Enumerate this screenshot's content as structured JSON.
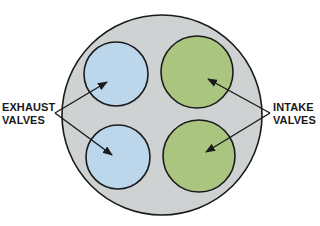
{
  "diagram": {
    "type": "cylinder-head-valve-layout",
    "colors": {
      "cylinder_fill": "#cfd2d2",
      "exhaust_fill": "#bcd7ec",
      "intake_fill": "#a9c57f",
      "outline": "#1a1a1a"
    },
    "labels": {
      "exhaust": {
        "line1": "EXHAUST",
        "line2": "VALVES"
      },
      "intake": {
        "line1": "INTAKE",
        "line2": "VALVES"
      }
    },
    "valves": [
      {
        "name": "exhaust-valve-top",
        "type": "exhaust",
        "cx": 116,
        "cy": 74,
        "r": 32
      },
      {
        "name": "exhaust-valve-bottom",
        "type": "exhaust",
        "cx": 118,
        "cy": 157,
        "r": 32
      },
      {
        "name": "intake-valve-top",
        "type": "intake",
        "cx": 197,
        "cy": 72,
        "r": 36
      },
      {
        "name": "intake-valve-bottom",
        "type": "intake",
        "cx": 199,
        "cy": 156,
        "r": 36
      }
    ]
  }
}
